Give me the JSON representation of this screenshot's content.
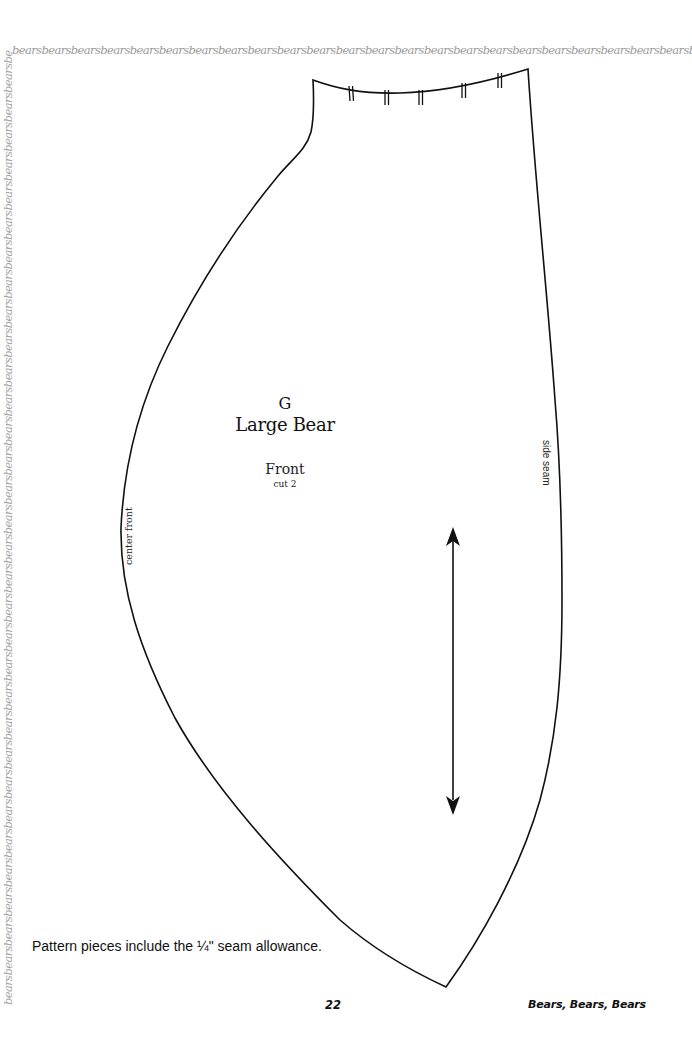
{
  "border": {
    "top_text": "bearsbearsbearsbearsbearsbearsbearsbearsbearsbearsbearsbearsbearsbearsbearsbearsbearsbearsbearsbearsbearsbearsbearsbearsbearsbearsbearsbearsbearsbearsbearsbears",
    "left_text": "bearsbearsbearsbearsbearsbearsbearsbearsbearsbearsbearsbearsbearsbearsbearsbearsbearsbearsbearsbearsbearsbearsbearsbearsbearsbearsbearsbearsbearsbearsbearsbearsbearsbearsbearsbearsbearsbearsbearsbearsbearsbearsbearsbears"
  },
  "pattern_piece": {
    "letter": "G",
    "name": "Large Bear",
    "part": "Front",
    "cut": "cut 2",
    "edge_labels": {
      "left": "center front",
      "right": "side seam"
    },
    "grainline": "double-arrow",
    "notch_marks": 5,
    "stroke_color": "#111111"
  },
  "footer": {
    "seam_note": "Pattern pieces include the ¼\" seam allowance.",
    "page_number": "22",
    "book_title": "Bears, Bears, Bears"
  }
}
